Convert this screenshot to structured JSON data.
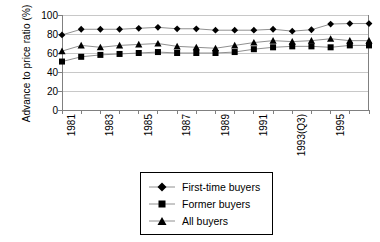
{
  "chart_data": {
    "type": "line",
    "title": "",
    "subtitle": "",
    "xlabel": "",
    "ylabel": "Advance to price ratio (%)",
    "ylim": [
      0,
      100
    ],
    "yticks": [
      0,
      20,
      40,
      60,
      80,
      100
    ],
    "ytick_labels": [
      "0",
      "20",
      "40",
      "60",
      "80",
      "100"
    ],
    "grid": "horizontal",
    "legend_position": "bottom-center",
    "x": [
      "1981",
      "1982",
      "1983",
      "1984",
      "1985",
      "1986",
      "1987",
      "1988",
      "1989",
      "1990",
      "1991",
      "1992",
      "1993(Q3)",
      "1994",
      "1995",
      "1996",
      "1997"
    ],
    "xtick_labels": [
      "1981",
      "",
      "1983",
      "",
      "1985",
      "",
      "1987",
      "",
      "1989",
      "",
      "1991",
      "",
      "1993(Q3)",
      "",
      "1995",
      "",
      ""
    ],
    "series": [
      {
        "name": "First-time buyers",
        "marker": "diamond",
        "color": "#000000",
        "values": [
          79,
          85,
          85,
          85,
          86,
          87,
          85.5,
          85.5,
          84,
          84,
          84,
          85,
          83,
          84.5,
          90.5,
          91,
          91
        ]
      },
      {
        "name": "Former buyers",
        "marker": "square",
        "color": "#000000",
        "values": [
          51,
          56,
          58,
          59,
          60,
          61,
          60,
          60,
          60,
          61,
          64,
          66,
          67,
          67,
          66,
          68,
          68
        ]
      },
      {
        "name": "All buyers",
        "marker": "triangle",
        "color": "#000000",
        "values": [
          62,
          68,
          66,
          68,
          69,
          70,
          67,
          66,
          65,
          68,
          71,
          73,
          72,
          73,
          75,
          73,
          73
        ]
      }
    ]
  },
  "legend": {
    "items": [
      {
        "label": "First-time buyers",
        "marker": "diamond"
      },
      {
        "label": "Former buyers",
        "marker": "square"
      },
      {
        "label": "All buyers",
        "marker": "triangle"
      }
    ]
  },
  "colors": {
    "axis": "#808080",
    "grid": "#c8c8c8",
    "series_line": "#909090",
    "marker": "#000000",
    "legend_border": "#000000",
    "background": "#ffffff"
  }
}
